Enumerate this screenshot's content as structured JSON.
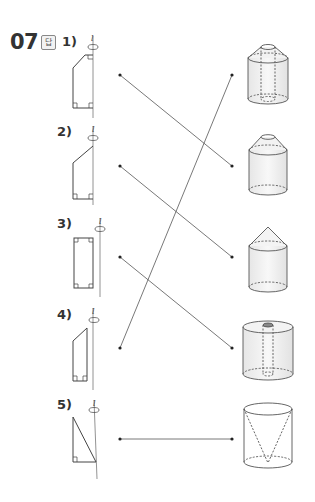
{
  "question": {
    "number": "07",
    "answer_badge": "답",
    "axis_symbol": "l"
  },
  "items": [
    {
      "label": "1)",
      "shape": "trapezoid-with-cut-corner",
      "matches_solid": 2
    },
    {
      "label": "2)",
      "shape": "pentagon-slanted-top",
      "matches_solid": 3
    },
    {
      "label": "3)",
      "shape": "rectangle-offset-from-axis",
      "matches_solid": 4
    },
    {
      "label": "4)",
      "shape": "trapezoid-slanted-top",
      "matches_solid": 1
    },
    {
      "label": "5)",
      "shape": "right-triangle",
      "matches_solid": 5
    }
  ],
  "solids": [
    {
      "id": 1,
      "name": "cylinder-with-frustum-top-and-hole"
    },
    {
      "id": 2,
      "name": "cylinder-with-frustum-top"
    },
    {
      "id": 3,
      "name": "cylinder-with-cone-top"
    },
    {
      "id": 4,
      "name": "cylinder-with-cylindrical-hole"
    },
    {
      "id": 5,
      "name": "cylinder-with-inverted-cone-removed"
    }
  ],
  "connections": [
    {
      "from": "1)",
      "to": 2
    },
    {
      "from": "2)",
      "to": 3
    },
    {
      "from": "3)",
      "to": 4
    },
    {
      "from": "4)",
      "to": 1
    },
    {
      "from": "5)",
      "to": 5
    }
  ],
  "colors": {
    "line": "#555555",
    "text": "#333333",
    "fill": "#ededed"
  }
}
